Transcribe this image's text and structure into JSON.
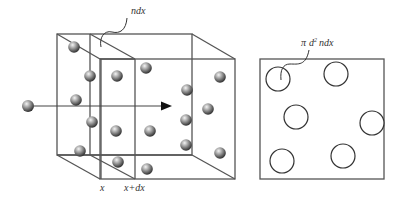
{
  "diagram": {
    "left_figure": {
      "label_ndx": "ndx",
      "label_x": "x",
      "label_x_plus_dx": "x+dx",
      "back_face": {
        "left": 57,
        "top": 34,
        "right": 192,
        "bottom": 155
      },
      "front_face": {
        "left": 100,
        "top": 59,
        "right": 235,
        "bottom": 179
      },
      "slice_planes": [
        {
          "name": "x",
          "back_x": 90,
          "front_x": 101
        },
        {
          "name": "x+dx",
          "back_x": 90,
          "front_x": 135
        }
      ],
      "incoming_molecule": {
        "cx": 28,
        "cy": 106
      },
      "arrow": {
        "x1": 34,
        "y1": 106,
        "x2": 172,
        "y2": 106
      },
      "spheres": [
        {
          "cx": 74,
          "cy": 47
        },
        {
          "cx": 90,
          "cy": 76
        },
        {
          "cx": 117,
          "cy": 76
        },
        {
          "cx": 146,
          "cy": 68
        },
        {
          "cx": 220,
          "cy": 77
        },
        {
          "cx": 187,
          "cy": 90
        },
        {
          "cx": 76,
          "cy": 100
        },
        {
          "cx": 92,
          "cy": 122
        },
        {
          "cx": 116,
          "cy": 131
        },
        {
          "cx": 150,
          "cy": 131
        },
        {
          "cx": 186,
          "cy": 120
        },
        {
          "cx": 208,
          "cy": 109
        },
        {
          "cx": 186,
          "cy": 145
        },
        {
          "cx": 80,
          "cy": 151
        },
        {
          "cx": 118,
          "cy": 162
        },
        {
          "cx": 147,
          "cy": 169
        },
        {
          "cx": 220,
          "cy": 153
        }
      ]
    },
    "right_figure": {
      "label_pi": "π",
      "label_d": "d",
      "label_exp": "2",
      "label_ndx": "ndx",
      "square": {
        "x": 260,
        "y": 59,
        "w": 124,
        "h": 120
      },
      "circles": [
        {
          "cx": 278,
          "cy": 79,
          "r": 12
        },
        {
          "cx": 336,
          "cy": 74,
          "r": 12
        },
        {
          "cx": 296,
          "cy": 117,
          "r": 12
        },
        {
          "cx": 372,
          "cy": 123,
          "r": 12
        },
        {
          "cx": 282,
          "cy": 161,
          "r": 12
        },
        {
          "cx": 343,
          "cy": 156,
          "r": 12
        }
      ]
    },
    "colors": {
      "edge": "#555555",
      "sphere_light": "#f2f2f2",
      "sphere_dark": "#2a2a2a",
      "text": "#333333"
    }
  }
}
